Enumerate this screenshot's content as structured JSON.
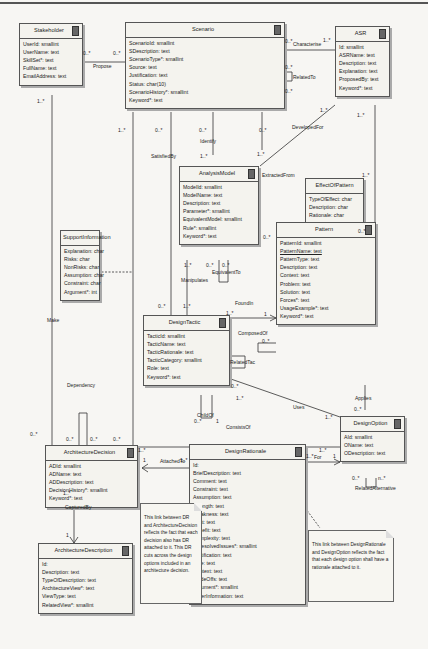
{
  "diagram": {
    "type": "UML class diagram",
    "classes": {
      "stakeholder": {
        "name": "Stakeholder",
        "attributes": [
          "UserId: smallint",
          "UserName: text",
          "SkillSet*: text",
          "FullName: text",
          "EmailAddress: text"
        ]
      },
      "scenario": {
        "name": "Scenario",
        "attributes": [
          "ScenarioId: smallint",
          "SDescription: text",
          "ScenarioType*: smallint",
          "Source: text",
          "Justification: text",
          "Status: char(10)",
          "ScenarioHistory*: smallint",
          "Keyword*: text"
        ]
      },
      "asr": {
        "name": "ASR",
        "attributes": [
          "Id: smallint",
          "ASRName: text",
          "Description: text",
          "Explanation: text",
          "ProposedBy: text",
          "Keyword*: text"
        ]
      },
      "analysis_model": {
        "name": "AnalysisModel",
        "attributes": [
          "ModelId: smallint",
          "ModelName: text",
          "Description: text",
          "Parameter*: smallint",
          "EquivalentModel: smallint",
          "Rule*: smallint",
          "Keyword*: text"
        ]
      },
      "effect_of_pattern": {
        "name": "EffectOfPattern",
        "attributes": [
          "TypeOfEffect: char",
          "Description: char",
          "Rationale: char"
        ]
      },
      "support_information": {
        "name": "SupportInformation",
        "attributes": [
          "Explanation: char",
          "Risks: char",
          "NonRisks: char",
          "Assumption: char",
          "Constraint: char",
          "Argument*: int"
        ]
      },
      "pattern": {
        "name": "Pattern",
        "attributes": [
          "PatternId: smallint",
          "PatternName: text",
          "PatternType: text",
          "Description: text",
          "Context: text",
          "Problem: text",
          "Solution: text",
          "Forces*: text",
          "UsageExample*: text",
          "Keyword*: text"
        ]
      },
      "design_tactic": {
        "name": "DesignTactic",
        "attributes": [
          "TacticId: smallint",
          "TacticName: text",
          "TacticRationale: text",
          "TacticCategory: smallint",
          "Role: text",
          "Keyword*: text"
        ]
      },
      "architecture_decision": {
        "name": "ArchitectureDecision",
        "attributes": [
          "ADId: smallint",
          "ADName: text",
          "ADDescription: text",
          "DecisionHistory*: smallint",
          "Keyword*: text"
        ]
      },
      "design_option": {
        "name": "DesignOption",
        "attributes": [
          "AId: smallint",
          "OName: text",
          "ODescription: text"
        ]
      },
      "design_rationale": {
        "name": "DesignRationale",
        "attributes": [
          "Id:",
          "BriefDescription: text",
          "Comment: text",
          "Constraint: text",
          "Assumption: text",
          "Strength: text",
          "Weakness: text",
          "Cost: text",
          "Benefit: text",
          "Complexity: text",
          "UnresolvedIssues*: smallint",
          "Justification: text",
          "Role: text",
          "Context: text",
          "TradeOffs: text",
          "Argument*: smallint",
          "OtherInformation: text"
        ]
      },
      "architecture_description": {
        "name": "ArchitectureDescription",
        "attributes": [
          "Id:",
          "Description: text",
          "TypeOfDescription: text",
          "ArchitectureView*: text",
          "ViewType: text",
          "RelatedView*: smallint"
        ]
      }
    },
    "relationships": {
      "propose": "Propose",
      "characterise": "Characterise",
      "related_to": "RelatedTo",
      "developed_for": "DevelopedFor",
      "satisfied_by": "SatisfiedBy",
      "identify": "Identify",
      "extracted_from": "ExtractedFrom",
      "equivalent_to": "EquivalentTo",
      "manipulates": "Manipulates",
      "found_in": "FoundIn",
      "composed_of": "ComposedOf",
      "related_tac": "RelatedTac",
      "make": "Make",
      "dependency": "Dependency",
      "child_of": "ChildOf",
      "uses": "Uses",
      "applies": "Applies",
      "consists_of": "ConsistsOf",
      "attached_to": "AttachedTo",
      "for": "For",
      "related_alternative": "RelatedAlternative",
      "captured_by": "CapturedBy"
    },
    "multiplicities": {
      "m_0n": "0..*",
      "m_1n": "1..*",
      "m_1": "1",
      "m_n": "n..*"
    },
    "notes": {
      "note_dr_ad": "This link between DR and ArchitectureDecision reflects the fact that each decision also has DR attached to it. This DR cuts across the design options included in an architecture decision.",
      "note_dr_do": "This link between DesignRationale and DesignOption reflects the fact that each design option shall have a rationale attached to it."
    }
  }
}
